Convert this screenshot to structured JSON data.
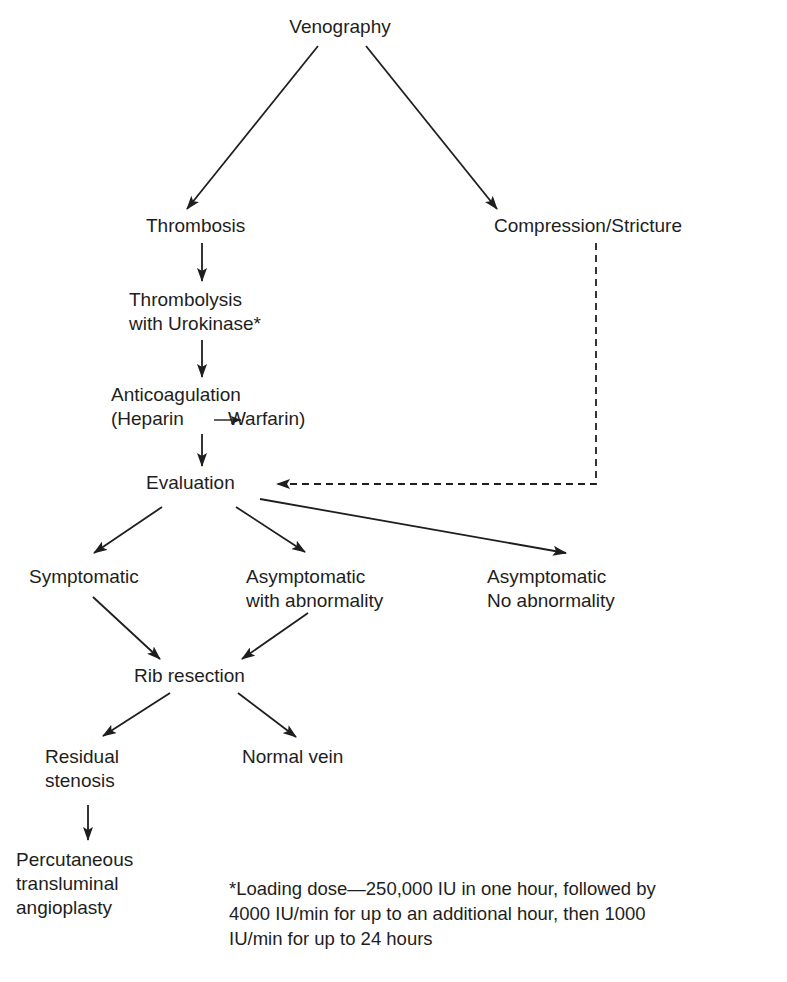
{
  "diagram": {
    "nodes": {
      "venography": {
        "lines": [
          "Venography"
        ]
      },
      "thrombosis": {
        "lines": [
          "Thrombosis"
        ]
      },
      "compression": {
        "lines": [
          "Compression/Stricture"
        ]
      },
      "thrombolysis": {
        "lines": [
          "Thrombolysis",
          "with Urokinase*"
        ]
      },
      "anticoagulation": {
        "lines": [
          "Anticoagulation",
          "(Heparin",
          "Warfarin)"
        ]
      },
      "evaluation": {
        "lines": [
          "Evaluation"
        ]
      },
      "symptomatic": {
        "lines": [
          "Symptomatic"
        ]
      },
      "asymptomatic_abnormal": {
        "lines": [
          "Asymptomatic",
          "with abnormality"
        ]
      },
      "asymptomatic_normal": {
        "lines": [
          "Asymptomatic",
          "No abnormality"
        ]
      },
      "rib_resection": {
        "lines": [
          "Rib resection"
        ]
      },
      "residual_stenosis": {
        "lines": [
          "Residual",
          "stenosis"
        ]
      },
      "normal_vein": {
        "lines": [
          "Normal vein"
        ]
      },
      "pta": {
        "lines": [
          "Percutaneous",
          "transluminal",
          "angioplasty"
        ]
      }
    },
    "edges": [
      {
        "from": "venography",
        "to": "thrombosis",
        "style": "solid"
      },
      {
        "from": "venography",
        "to": "compression",
        "style": "solid"
      },
      {
        "from": "thrombosis",
        "to": "thrombolysis",
        "style": "solid"
      },
      {
        "from": "thrombolysis",
        "to": "anticoagulation",
        "style": "solid"
      },
      {
        "from": "anticoagulation",
        "to": "evaluation",
        "style": "solid"
      },
      {
        "from": "compression",
        "to": "evaluation",
        "style": "dashed"
      },
      {
        "from": "evaluation",
        "to": "symptomatic",
        "style": "solid"
      },
      {
        "from": "evaluation",
        "to": "asymptomatic_abnormal",
        "style": "solid"
      },
      {
        "from": "evaluation",
        "to": "asymptomatic_normal",
        "style": "solid"
      },
      {
        "from": "symptomatic",
        "to": "rib_resection",
        "style": "solid"
      },
      {
        "from": "asymptomatic_abnormal",
        "to": "rib_resection",
        "style": "solid"
      },
      {
        "from": "rib_resection",
        "to": "residual_stenosis",
        "style": "solid"
      },
      {
        "from": "rib_resection",
        "to": "normal_vein",
        "style": "solid"
      },
      {
        "from": "residual_stenosis",
        "to": "pta",
        "style": "solid"
      }
    ],
    "footnote": {
      "lines": [
        "*Loading dose—250,000 IU in one hour, followed by",
        "4000 IU/min for up to an additional hour, then 1000",
        "IU/min for up to 24 hours"
      ]
    },
    "colors": {
      "ink": "#1e1e1e",
      "background": "#ffffff"
    }
  }
}
